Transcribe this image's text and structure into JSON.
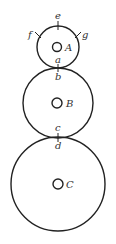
{
  "diagram": {
    "stroke_color": "#222222",
    "circles": [
      {
        "id": "A",
        "label": "A",
        "cx": 58,
        "cy": 47,
        "r": 21,
        "inner_r": 4.5
      },
      {
        "id": "B",
        "label": "B",
        "cx": 58,
        "cy": 103,
        "r": 35,
        "inner_r": 5
      },
      {
        "id": "C",
        "label": "C",
        "cx": 58,
        "cy": 184,
        "r": 47,
        "inner_r": 5
      }
    ],
    "points": [
      {
        "label": "e",
        "position": "top of circle A"
      },
      {
        "label": "f",
        "position": "upper-left of circle A"
      },
      {
        "label": "g",
        "position": "upper-right of circle A"
      },
      {
        "label": "a",
        "position": "bottom of circle A (tangent with B)"
      },
      {
        "label": "b",
        "position": "top of circle B (tangent with A)"
      },
      {
        "label": "c",
        "position": "bottom of circle B (tangent with C)"
      },
      {
        "label": "d",
        "position": "top of circle C (tangent with B)"
      }
    ],
    "labels": {
      "e": "e",
      "f": "f",
      "g": "g",
      "a": "a",
      "b": "b",
      "c": "c",
      "d": "d",
      "A": "A",
      "B": "B",
      "C": "C"
    }
  }
}
